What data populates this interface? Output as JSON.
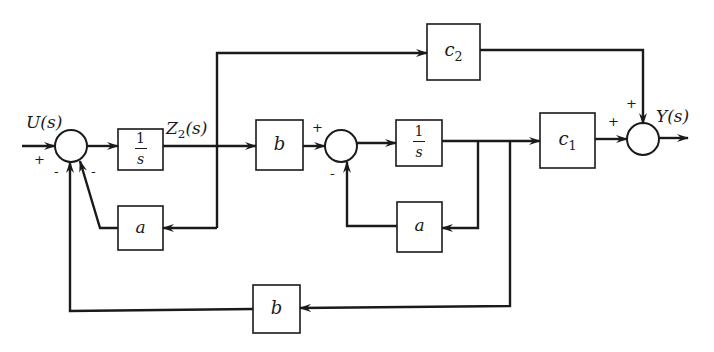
{
  "diagram": {
    "title": "",
    "colors": {
      "line": "#1a1a1a",
      "background": "#ffffff"
    },
    "signals": {
      "input": "U(s)",
      "state": "Z",
      "state_sub": "2",
      "state_suffix": "(s)",
      "output": "Y(s)"
    },
    "blocks": {
      "integrator1": {
        "num": "1",
        "den": "s"
      },
      "feedback_a1": {
        "label": "a"
      },
      "gain_b1": {
        "label": "b"
      },
      "integrator2": {
        "num": "1",
        "den": "s"
      },
      "feedback_a2": {
        "label": "a"
      },
      "gain_c1": {
        "label": "c",
        "sub": "1"
      },
      "gain_c2": {
        "label": "c",
        "sub": "2"
      },
      "feedback_b2": {
        "label": "b"
      }
    },
    "signs": {
      "sum1_input": "+",
      "sum1_fb_outer": "-",
      "sum1_fb_inner": "-",
      "sum2_input": "+",
      "sum2_fb": "-",
      "sum3_c1": "+",
      "sum3_c2": "+"
    }
  }
}
